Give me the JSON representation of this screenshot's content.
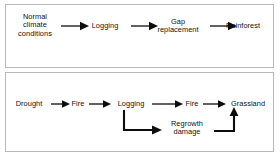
{
  "figure": {
    "background_color": "#ffffff",
    "border_color": "#b9b9b9",
    "arrow_color": "#0d0d0d",
    "text_color": "#111111"
  },
  "panels": [
    {
      "id": "panel-top",
      "name": "undisturbed-rainforest-pathway",
      "nodes": [
        {
          "label": "Normal\nclimate\nconditions"
        },
        {
          "label": "Logging"
        },
        {
          "label": "Gap\nreplacement"
        },
        {
          "label": "Rainforest"
        }
      ],
      "connectors": [
        {
          "from": "Normal climate conditions",
          "to": "Logging",
          "style": "straight-arrow"
        },
        {
          "from": "Logging",
          "to": "Gap replacement",
          "style": "straight-arrow"
        },
        {
          "from": "Gap replacement",
          "to": "Rainforest",
          "style": "straight-arrow"
        }
      ]
    },
    {
      "id": "panel-bottom",
      "name": "degraded-grassland-pathway",
      "nodes": [
        {
          "label": "Drought"
        },
        {
          "label": "Fire"
        },
        {
          "label": "Logging"
        },
        {
          "label": "Fire"
        },
        {
          "label": "Grassland"
        },
        {
          "label": "Regrowth\ndamage"
        }
      ],
      "connectors": [
        {
          "from": "Drought",
          "to": "Fire",
          "style": "straight-arrow"
        },
        {
          "from": "Fire",
          "to": "Logging",
          "style": "straight-arrow"
        },
        {
          "from": "Logging",
          "to": "Fire",
          "style": "straight-arrow"
        },
        {
          "from": "Fire",
          "to": "Grassland",
          "style": "straight-arrow"
        },
        {
          "from": "Logging",
          "to": "Regrowth damage",
          "style": "elbow-down-right-arrow"
        },
        {
          "from": "Regrowth damage",
          "to": "Grassland",
          "style": "elbow-right-up-arrow"
        }
      ]
    }
  ]
}
